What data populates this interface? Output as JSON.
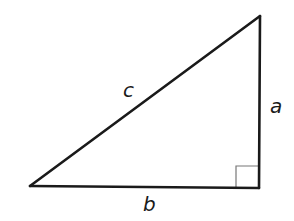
{
  "diagram": {
    "type": "right-triangle",
    "colors": {
      "stroke": "#1a1a1a",
      "right_angle_marker": "#777777",
      "background": "#ffffff"
    },
    "vertices": {
      "left": [
        30,
        186
      ],
      "top_right": [
        260,
        16
      ],
      "bottom_right": [
        259,
        188
      ]
    },
    "sides": {
      "hypotenuse": {
        "label": "c"
      },
      "vertical_leg": {
        "label": "a"
      },
      "horizontal_leg": {
        "label": "b"
      }
    },
    "right_angle_marker": {
      "visible": true,
      "size": 23
    }
  }
}
